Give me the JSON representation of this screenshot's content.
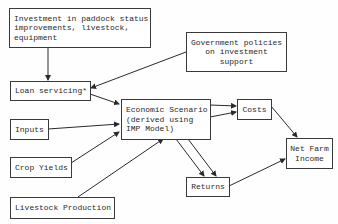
{
  "diagram": {
    "type": "flowchart",
    "nodes": {
      "investment": {
        "label": "Investment in paddock status\nimprovements, livestock,\nequipment"
      },
      "government": {
        "label": "Government policies\non investment\nsupport"
      },
      "loan": {
        "label": "Loan servicing*"
      },
      "inputs": {
        "label": "Inputs"
      },
      "crop": {
        "label": "Crop Yields"
      },
      "livestock": {
        "label": "Livestock Production"
      },
      "economic": {
        "label": "Economic Scenario\n(derived using\nIMP Model)"
      },
      "costs": {
        "label": "Costs"
      },
      "returns": {
        "label": "Returns"
      },
      "netfarm": {
        "label": "Net Farm\nIncome"
      }
    },
    "edges": [
      {
        "from": "investment",
        "to": "loan"
      },
      {
        "from": "government",
        "to": "loan"
      },
      {
        "from": "loan",
        "to": "economic"
      },
      {
        "from": "inputs",
        "to": "economic"
      },
      {
        "from": "crop",
        "to": "economic"
      },
      {
        "from": "livestock",
        "to": "economic"
      },
      {
        "from": "economic",
        "to": "costs",
        "count": 2
      },
      {
        "from": "economic",
        "to": "returns",
        "count": 2
      },
      {
        "from": "costs",
        "to": "netfarm"
      },
      {
        "from": "returns",
        "to": "netfarm"
      }
    ],
    "colors": {
      "line": "#2a2a2a",
      "border": "#3a3a3a",
      "text": "#2a2a2a",
      "background": "#ffffff"
    }
  }
}
